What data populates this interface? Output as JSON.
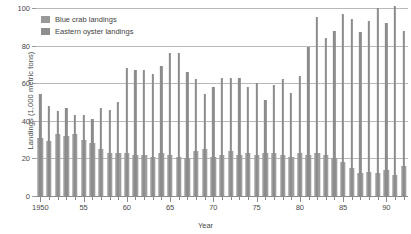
{
  "chart_data": {
    "type": "bar",
    "title": "",
    "xlabel": "Year",
    "ylabel": "Landings (1,000 metric tons)",
    "ylim": [
      0,
      100
    ],
    "xlim": [
      1950,
      1992
    ],
    "grid": true,
    "legend_position": "top-left",
    "y_ticks": [
      0,
      20,
      40,
      60,
      80,
      100
    ],
    "y_tick_labels": [
      "0",
      "20",
      "40",
      "60",
      "80",
      "100"
    ],
    "x_tick_labels": [
      "1950",
      "55",
      "60",
      "65",
      "70",
      "75",
      "80",
      "85",
      "90"
    ],
    "x_tick_years": [
      1950,
      1955,
      1960,
      1965,
      1970,
      1975,
      1980,
      1985,
      1990
    ],
    "categories": [
      1950,
      1951,
      1952,
      1953,
      1954,
      1955,
      1956,
      1957,
      1958,
      1959,
      1960,
      1961,
      1962,
      1963,
      1964,
      1965,
      1966,
      1967,
      1968,
      1969,
      1970,
      1971,
      1972,
      1973,
      1974,
      1975,
      1976,
      1977,
      1978,
      1979,
      1980,
      1981,
      1982,
      1983,
      1984,
      1985,
      1986,
      1987,
      1988,
      1989,
      1990,
      1991,
      1992
    ],
    "series": [
      {
        "name": "Blue crab landings",
        "color": "#8c8c8c",
        "values": [
          54,
          48,
          45,
          47,
          43,
          43,
          41,
          47,
          46,
          50,
          68,
          67,
          67,
          65,
          69,
          76,
          76,
          66,
          62,
          54,
          58,
          63,
          63,
          63,
          58,
          60,
          51,
          59,
          62,
          55,
          64,
          79,
          95,
          84,
          88,
          97,
          94,
          87,
          93,
          100,
          92,
          101,
          88
        ]
      },
      {
        "name": "Eastern oyster landings",
        "color": "#9e9e9e",
        "values": [
          31,
          29,
          33,
          32,
          33,
          30,
          28,
          25,
          23,
          23,
          23,
          22,
          22,
          21,
          23,
          22,
          21,
          20,
          24,
          25,
          21,
          22,
          24,
          22,
          23,
          22,
          23,
          23,
          22,
          21,
          23,
          22,
          23,
          22,
          20,
          18,
          15,
          12,
          13,
          12,
          14,
          11,
          16
        ]
      }
    ]
  },
  "legend": {
    "items": [
      {
        "label": "Blue crab landings"
      },
      {
        "label": "Eastern oyster landings"
      }
    ]
  }
}
